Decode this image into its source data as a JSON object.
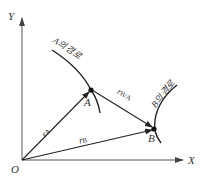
{
  "diagram": {
    "axes": {
      "x_label": "X",
      "y_label": "Y",
      "origin_label": "O"
    },
    "points": {
      "a_label": "A",
      "b_label": "B"
    },
    "paths": {
      "a_path_label": "A의 경로",
      "b_path_label": "B의 경로"
    },
    "vectors": {
      "r_a": {
        "symbol": "r",
        "subscript": "A"
      },
      "r_b": {
        "symbol": "r",
        "subscript": "B"
      },
      "r_ba": {
        "symbol": "r",
        "subscript": "B/A"
      }
    },
    "colors": {
      "stroke": "#222222",
      "text": "#333333",
      "axis": "#555555"
    }
  }
}
